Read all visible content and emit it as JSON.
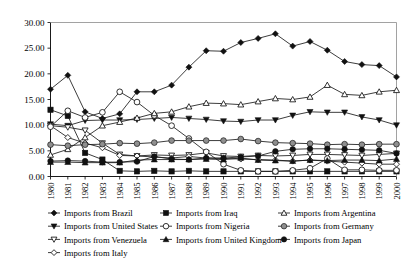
{
  "chart_data": {
    "type": "line",
    "title": "",
    "subtitle": "",
    "xlabel": "",
    "ylabel": "",
    "grid": false,
    "legend_position": "bottom",
    "legend_columns": 3,
    "ylim": [
      0,
      30
    ],
    "ytick_labels": [
      "0.00",
      "5.00",
      "10.00",
      "15.00",
      "20.00",
      "25.00",
      "30.00"
    ],
    "ytick_values": [
      0,
      5,
      10,
      15,
      20,
      25,
      30
    ],
    "categories": [
      "1980",
      "1981",
      "1982",
      "1983",
      "1984",
      "1985",
      "1986",
      "1987",
      "1988",
      "1989",
      "1990",
      "1991",
      "1992",
      "1993",
      "1994",
      "1995",
      "1996",
      "1997",
      "1998",
      "1999",
      "2000"
    ],
    "x": [
      1980,
      1981,
      1982,
      1983,
      1984,
      1985,
      1986,
      1987,
      1988,
      1989,
      1990,
      1991,
      1992,
      1993,
      1994,
      1995,
      1996,
      1997,
      1998,
      1999,
      2000
    ],
    "series": [
      {
        "name": "Imports from Brazil",
        "marker": "filled-diamond",
        "values": [
          17.0,
          19.7,
          12.6,
          11.3,
          12.2,
          16.5,
          16.5,
          17.8,
          21.3,
          24.5,
          24.4,
          26.1,
          26.9,
          27.8,
          25.4,
          26.3,
          24.6,
          22.4,
          21.8,
          21.6,
          19.4
        ]
      },
      {
        "name": "Imports from United States",
        "marker": "filled-down-triangle",
        "values": [
          10.2,
          9.9,
          10.9,
          11.0,
          11.0,
          11.1,
          11.3,
          11.5,
          11.3,
          11.1,
          10.8,
          10.7,
          11.0,
          11.0,
          11.9,
          12.6,
          12.5,
          12.5,
          11.6,
          11.0,
          10.0
        ]
      },
      {
        "name": "Imports from Venezuela",
        "marker": "open-down-triangle",
        "values": [
          9.9,
          9.6,
          9.0,
          6.5,
          4.3,
          4.0,
          4.2,
          4.1,
          4.2,
          4.6,
          4.0,
          3.9,
          4.1,
          4.0,
          4.1,
          4.3,
          4.3,
          4.2,
          4.1,
          4.3,
          4.5
        ]
      },
      {
        "name": "Imports from Italy",
        "marker": "open-diamond",
        "values": [
          9.9,
          7.6,
          6.5,
          5.6,
          4.1,
          4.0,
          3.8,
          3.6,
          3.9,
          3.6,
          3.5,
          3.4,
          3.3,
          3.2,
          3.0,
          3.2,
          3.0,
          2.8,
          2.6,
          2.4,
          2.4
        ]
      },
      {
        "name": "Imports from Iraq",
        "marker": "filled-square",
        "values": [
          13.0,
          11.8,
          4.6,
          3.3,
          1.1,
          1.0,
          1.1,
          1.0,
          1.1,
          1.0,
          1.0,
          1.0,
          1.0,
          1.0,
          1.0,
          1.0,
          1.0,
          1.0,
          1.0,
          1.0,
          1.0
        ]
      },
      {
        "name": "Imports from Nigeria",
        "marker": "open-circle",
        "values": [
          9.7,
          12.8,
          11.5,
          12.5,
          16.5,
          14.5,
          11.9,
          9.9,
          7.4,
          4.8,
          2.4,
          1.2,
          1.0,
          1.0,
          1.2,
          1.6,
          3.5,
          1.3,
          1.3,
          1.2,
          1.2
        ]
      },
      {
        "name": "Imports from United Kingdom",
        "marker": "filled-up-triangle",
        "values": [
          2.8,
          2.8,
          2.7,
          2.7,
          2.7,
          3.2,
          3.3,
          3.3,
          3.3,
          3.4,
          3.3,
          3.6,
          3.2,
          3.1,
          3.0,
          3.2,
          3.1,
          3.2,
          3.2,
          3.1,
          3.4
        ]
      },
      {
        "name": "Imports from Argentina",
        "marker": "open-up-triangle",
        "values": [
          4.2,
          5.3,
          7.6,
          9.9,
          10.6,
          11.4,
          12.3,
          12.6,
          13.6,
          14.3,
          14.2,
          14.0,
          14.6,
          15.2,
          15.0,
          15.5,
          17.8,
          16.0,
          15.8,
          16.5,
          16.8
        ]
      },
      {
        "name": "Imports from Germany",
        "marker": "gray-circle",
        "values": [
          6.2,
          6.0,
          6.2,
          6.3,
          6.5,
          6.4,
          6.6,
          7.0,
          7.0,
          7.0,
          7.0,
          7.3,
          6.9,
          6.6,
          6.5,
          6.4,
          6.2,
          6.3,
          6.2,
          6.3,
          6.3
        ]
      },
      {
        "name": "Imports from Japan",
        "marker": "filled-circle",
        "values": [
          3.0,
          3.1,
          3.0,
          2.8,
          2.8,
          2.9,
          3.9,
          3.4,
          3.3,
          3.6,
          3.6,
          3.8,
          4.0,
          4.9,
          5.3,
          5.4,
          5.4,
          5.3,
          5.2,
          5.1,
          4.5
        ]
      }
    ]
  },
  "legend": {
    "columns": [
      {
        "items": [
          {
            "label": "Imports from Brazil",
            "marker": "filled-diamond"
          },
          {
            "label": "Imports from United States",
            "marker": "filled-down-triangle"
          },
          {
            "label": "Imports from Venezuela",
            "marker": "open-down-triangle"
          },
          {
            "label": "Imports from Italy",
            "marker": "open-diamond"
          }
        ]
      },
      {
        "items": [
          {
            "label": "Imports from Iraq",
            "marker": "filled-square"
          },
          {
            "label": "Imports from Nigeria",
            "marker": "open-circle"
          },
          {
            "label": "Imports from United Kingdom",
            "marker": "filled-up-triangle"
          }
        ]
      },
      {
        "items": [
          {
            "label": "Imports from Argentina",
            "marker": "open-up-triangle"
          },
          {
            "label": "Imports from Germany",
            "marker": "gray-circle"
          },
          {
            "label": "Imports from Japan",
            "marker": "filled-circle"
          }
        ]
      }
    ]
  }
}
